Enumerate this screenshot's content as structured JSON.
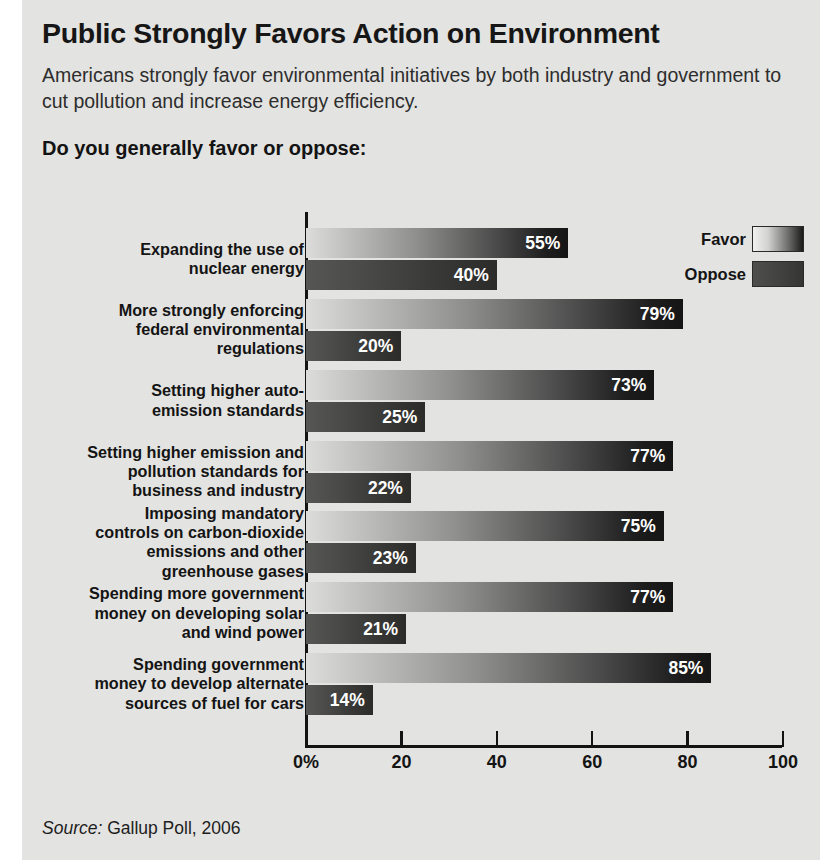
{
  "header": {
    "title": "Public Strongly Favors Action on Environment",
    "subtitle": "Americans strongly favor environmental initiatives by both industry and government to cut pollution and increase energy efficiency.",
    "question": "Do you generally favor or oppose:"
  },
  "legend": {
    "favor_label": "Favor",
    "oppose_label": "Oppose"
  },
  "source": {
    "prefix": "Source:",
    "text": " Gallup Poll, 2006"
  },
  "colors": {
    "background": "#e3e3e1",
    "axis": "#131313",
    "favor_start": "#dcdcda",
    "favor_end": "#151515",
    "oppose_start": "#565654",
    "oppose_end": "#2b2b29",
    "value_text": "#ffffff",
    "title_text": "#161616"
  },
  "chart_data": {
    "type": "bar",
    "orientation": "horizontal",
    "title": "Public Strongly Favors Action on Environment",
    "subtitle": "Americans strongly favor environmental initiatives by both industry and government to cut pollution and increase energy efficiency.",
    "question": "Do you generally favor or oppose:",
    "xlabel": "",
    "ylabel": "",
    "xlim": [
      0,
      100
    ],
    "xticks": [
      0,
      20,
      40,
      60,
      80,
      100
    ],
    "xticklabels": [
      "0%",
      "20",
      "40",
      "60",
      "80",
      "100"
    ],
    "grid": false,
    "legend_position": "top-right",
    "legend": [
      "Favor",
      "Oppose"
    ],
    "categories": [
      "Expanding the use of\nnuclear energy",
      "More strongly enforcing\nfederal environmental\nregulations",
      "Setting higher auto-\nemission standards",
      "Setting higher emission and\npollution standards for\nbusiness and industry",
      "Imposing mandatory\ncontrols on carbon-dioxide\nemissions and other\ngreenhouse gases",
      "Spending more government\nmoney on developing solar\nand wind power",
      "Spending government\nmoney to develop alternate\nsources of fuel for cars"
    ],
    "series": [
      {
        "name": "Favor",
        "values": [
          55,
          79,
          73,
          77,
          75,
          77,
          85
        ],
        "labels": [
          "55%",
          "79%",
          "73%",
          "77%",
          "75%",
          "77%",
          "85%"
        ]
      },
      {
        "name": "Oppose",
        "values": [
          40,
          20,
          25,
          22,
          23,
          21,
          14
        ],
        "labels": [
          "40%",
          "20%",
          "25%",
          "22%",
          "23%",
          "21%",
          "14%"
        ]
      }
    ],
    "source": "Source: Gallup Poll, 2006"
  }
}
